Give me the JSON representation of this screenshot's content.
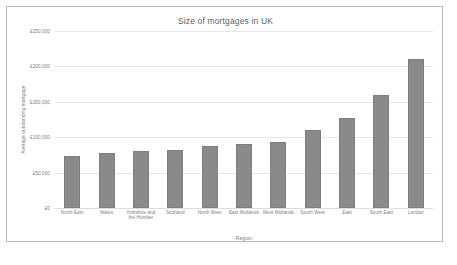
{
  "frame": {
    "border_color": "#b9b9b9",
    "background": "#ffffff"
  },
  "chart_data": {
    "type": "bar",
    "title": "Size of mortgages in UK",
    "xlabel": "Region",
    "ylabel": "Average outstanding mortgage",
    "categories": [
      "North East",
      "Wales",
      "Yorkshire and the Humber",
      "Scotland",
      "North West",
      "East Midlands",
      "West Midlands",
      "South West",
      "East",
      "South East",
      "London"
    ],
    "values": [
      74000,
      78000,
      80000,
      82000,
      87000,
      91000,
      93000,
      110000,
      127000,
      160000,
      210000
    ],
    "ylim": [
      0,
      250000
    ],
    "ytick_values": [
      0,
      50000,
      100000,
      150000,
      200000,
      250000
    ],
    "ytick_labels": [
      "£0",
      "£50,000",
      "£100,000",
      "£150,000",
      "£200,000",
      "£250,000"
    ],
    "grid": true,
    "legend": false,
    "bar_color": "#8a8a8a",
    "grid_color": "#e8e8e8"
  }
}
